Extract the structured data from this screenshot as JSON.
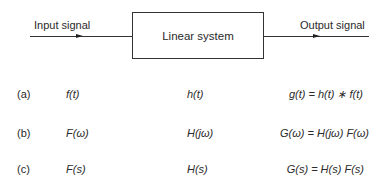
{
  "diagram": {
    "input_label": "Input signal",
    "output_label": "Output signal",
    "system_label": "Linear system"
  },
  "rows": [
    {
      "label": "(a)",
      "input": "f(t)",
      "system": "h(t)",
      "output": "g(t) = h(t) ∗  f(t)"
    },
    {
      "label": "(b)",
      "input": "F(ω)",
      "system": "H(jω)",
      "output": "G(ω) = H(jω) F(ω)"
    },
    {
      "label": "(c)",
      "input": "F(s)",
      "system": "H(s)",
      "output": "G(s) = H(s) F(s)"
    }
  ]
}
